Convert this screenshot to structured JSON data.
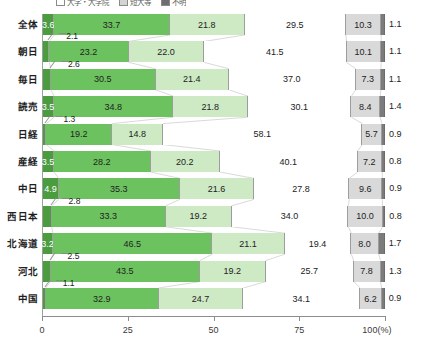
{
  "legend": {
    "items": [
      {
        "label": "大学・大学院",
        "swatch": "white"
      },
      {
        "label": "短大等",
        "swatch": "gray"
      },
      {
        "label": "不明",
        "swatch": "dark"
      }
    ]
  },
  "axis": {
    "ticks": [
      "0",
      "25",
      "50",
      "75",
      "100(%)"
    ],
    "unit": "(%)",
    "min": 0,
    "max": 100
  },
  "chart_data": {
    "type": "bar",
    "orientation": "horizontal",
    "stacked": true,
    "title": "",
    "xlabel": "(%)",
    "ylabel": "",
    "xlim": [
      0,
      100
    ],
    "grid": false,
    "legend_position": "top",
    "categories": [
      "全体",
      "朝日",
      "毎日",
      "読売",
      "日経",
      "産経",
      "中日",
      "西日本",
      "北海道",
      "河北",
      "中国"
    ],
    "series": [
      {
        "name": "seg1",
        "color": "#4a9c3f",
        "values": [
          3.6,
          2.1,
          2.6,
          3.5,
          1.3,
          3.5,
          4.9,
          2.8,
          3.2,
          2.5,
          1.1
        ]
      },
      {
        "name": "seg2",
        "color": "#6cc25f",
        "values": [
          33.7,
          23.2,
          30.5,
          34.8,
          19.2,
          28.2,
          35.3,
          33.3,
          46.5,
          43.5,
          32.9
        ]
      },
      {
        "name": "seg3",
        "color": "#cdeac4",
        "values": [
          21.8,
          22.0,
          21.4,
          21.8,
          14.8,
          20.2,
          21.6,
          19.2,
          21.1,
          19.2,
          24.7
        ]
      },
      {
        "name": "seg4",
        "color": "#ffffff",
        "values": [
          29.5,
          41.5,
          37.0,
          30.1,
          58.1,
          40.1,
          27.8,
          34.0,
          19.4,
          25.7,
          34.1
        ]
      },
      {
        "name": "seg5",
        "color": "#d9d9d9",
        "values": [
          10.3,
          10.1,
          7.3,
          8.4,
          5.7,
          7.2,
          9.6,
          10.0,
          8.0,
          7.8,
          6.2
        ]
      },
      {
        "name": "seg6",
        "color": "#7b7b7b",
        "values": [
          1.1,
          1.1,
          1.1,
          1.4,
          0.9,
          0.8,
          0.9,
          0.8,
          1.7,
          1.3,
          0.9
        ]
      }
    ],
    "rows": [
      {
        "label": "全体",
        "values": [
          3.6,
          33.7,
          21.8,
          29.5,
          10.3,
          1.1
        ],
        "first_inside": true
      },
      {
        "label": "朝日",
        "values": [
          2.1,
          23.2,
          22.0,
          41.5,
          10.1,
          1.1
        ],
        "first_inside": false
      },
      {
        "label": "毎日",
        "values": [
          2.6,
          30.5,
          21.4,
          37.0,
          7.3,
          1.1
        ],
        "first_inside": false
      },
      {
        "label": "読売",
        "values": [
          3.5,
          34.8,
          21.8,
          30.1,
          8.4,
          1.4
        ],
        "first_inside": true
      },
      {
        "label": "日経",
        "values": [
          1.3,
          19.2,
          14.8,
          58.1,
          5.7,
          0.9
        ],
        "first_inside": false
      },
      {
        "label": "産経",
        "values": [
          3.5,
          28.2,
          20.2,
          40.1,
          7.2,
          0.8
        ],
        "first_inside": true
      },
      {
        "label": "中日",
        "values": [
          4.9,
          35.3,
          21.6,
          27.8,
          9.6,
          0.9
        ],
        "first_inside": true
      },
      {
        "label": "西日本",
        "values": [
          2.8,
          33.3,
          19.2,
          34.0,
          10.0,
          0.8
        ],
        "first_inside": false
      },
      {
        "label": "北海道",
        "values": [
          3.2,
          46.5,
          21.1,
          19.4,
          8.0,
          1.7
        ],
        "first_inside": true
      },
      {
        "label": "河北",
        "values": [
          2.5,
          43.5,
          19.2,
          25.7,
          7.8,
          1.3
        ],
        "first_inside": false
      },
      {
        "label": "中国",
        "values": [
          1.1,
          32.9,
          24.7,
          34.1,
          6.2,
          0.9
        ],
        "first_inside": false
      }
    ]
  }
}
